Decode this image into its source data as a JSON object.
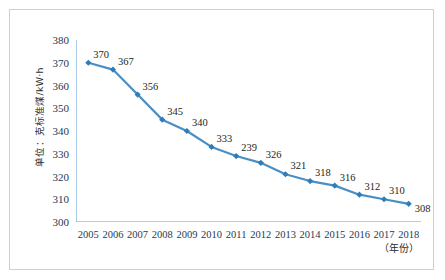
{
  "chart_data": {
    "type": "line",
    "title": "",
    "subtitle": "",
    "xlabel": "（年份）",
    "ylabel": "单位：克标准煤/kW·h",
    "categories": [
      "2005",
      "2006",
      "2007",
      "2008",
      "2009",
      "2010",
      "2011",
      "2012",
      "2013",
      "2014",
      "2015",
      "2016",
      "2017",
      "2018"
    ],
    "values": [
      370,
      367,
      356,
      345,
      340,
      333,
      329,
      326,
      321,
      318,
      316,
      312,
      310,
      308
    ],
    "point_labels": [
      "370",
      "367",
      "356",
      "345",
      "340",
      "333",
      "239",
      "326",
      "321",
      "318",
      "316",
      "312",
      "310",
      "308"
    ],
    "series": [
      {
        "name": "供电标准煤耗",
        "values": [
          370,
          367,
          356,
          345,
          340,
          333,
          329,
          326,
          321,
          318,
          316,
          312,
          310,
          308
        ]
      }
    ],
    "ylim": [
      300,
      380
    ],
    "ytick_step": 10,
    "ytick_labels": [
      "300",
      "310",
      "320",
      "330",
      "340",
      "350",
      "360",
      "370",
      "380"
    ],
    "grid": false,
    "legend": "none",
    "line_color": "#4a8fc4",
    "marker_color": "#2f7cb8",
    "marker_shape": "diamond",
    "axis_color": "#5b9bd5",
    "label_color": "#231f20",
    "tick_label_color": "#1f3a52",
    "frame_color": "#c2d3e4",
    "background": "#ffffff"
  }
}
